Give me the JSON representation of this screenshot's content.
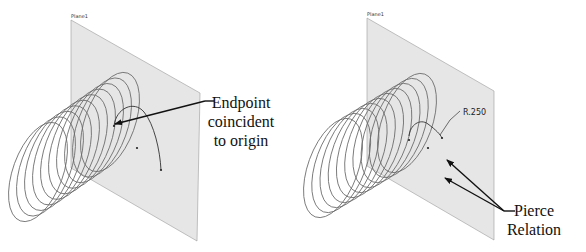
{
  "colors": {
    "background": "#ffffff",
    "plane_fill": "#e6e6e6",
    "plane_edge": "#9a9a9a",
    "helix": "#6a6a6a",
    "arrow": "#111111",
    "text": "#111111"
  },
  "panels": [
    {
      "id": "left",
      "plane": {
        "label": "Plane1",
        "label_pos": [
          71,
          18
        ],
        "points": [
          [
            71,
            20
          ],
          [
            200,
            93
          ],
          [
            197,
            241
          ],
          [
            71,
            168
          ]
        ]
      },
      "helix": {
        "turns": 10,
        "start_center": [
          38,
          172
        ],
        "end_center": [
          110,
          122
        ],
        "rx": 25,
        "ry": 52,
        "rotate": 20
      },
      "sketch": {
        "arc": "M 114 126 C 116 108, 134 100, 144 112 C 154 124, 160 150, 161 170",
        "center_dot": [
          137,
          148
        ],
        "end_dot": [
          161,
          170
        ],
        "origin_dot": [
          114,
          126
        ]
      },
      "dimension": null,
      "callouts": [
        {
          "lines": [
            "Endpoint",
            "coincident",
            "to origin"
          ],
          "text_x": 241,
          "text_y": 108,
          "line_height": 19,
          "anchor": "middle",
          "leader_from": [
            214,
            101
          ],
          "leader_elbow": [
            205,
            101
          ],
          "arrow_to": [
            115,
            124
          ]
        }
      ]
    },
    {
      "id": "right",
      "plane": {
        "label": "Plane1",
        "label_pos": [
          367,
          16
        ],
        "points": [
          [
            367,
            18
          ],
          [
            494,
            91
          ],
          [
            494,
            240
          ],
          [
            367,
            166
          ]
        ]
      },
      "helix": {
        "turns": 10,
        "start_center": [
          333,
          168
        ],
        "end_center": [
          407,
          123
        ],
        "rx": 25,
        "ry": 52,
        "rotate": 20
      },
      "sketch": {
        "arc": "M 409 136 C 410 125, 420 118, 428 124 C 436 130, 440 134, 442 138",
        "center_dot": [
          428,
          148
        ],
        "end_dot": [
          442,
          138
        ],
        "origin_dot": [
          409,
          140
        ]
      },
      "dimension": {
        "label": "R.250",
        "text_pos": [
          463,
          115
        ],
        "leader": [
          [
            460,
            111
          ],
          [
            450,
            120
          ],
          [
            440,
            135
          ]
        ]
      },
      "callouts": [
        {
          "lines": [
            "Pierce",
            "Relation"
          ],
          "text_x": 534,
          "text_y": 216,
          "line_height": 19,
          "anchor": "middle",
          "leader_from": [
            515,
            211
          ],
          "leader_elbow": [
            504,
            211
          ],
          "arrow_targets": [
            [
              447,
              160
            ],
            [
              445,
              178
            ]
          ]
        }
      ]
    }
  ]
}
